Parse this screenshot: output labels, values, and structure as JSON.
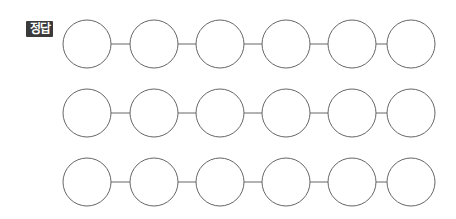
{
  "badge": {
    "label": "정답"
  },
  "diagram": {
    "rows": 3,
    "circles_per_row": 6,
    "circle_centers_x": [
      87,
      154,
      220,
      286,
      352,
      411
    ],
    "row_centers_y": [
      44,
      113,
      182
    ],
    "radius": 24,
    "stroke_color": "#666666",
    "fill_color": "#ffffff"
  }
}
